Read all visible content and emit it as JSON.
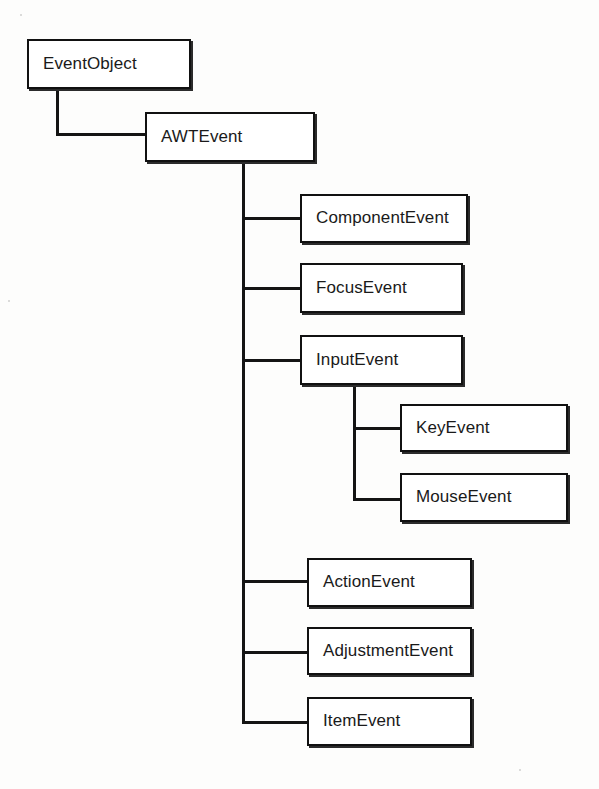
{
  "diagram": {
    "type": "class-hierarchy-tree",
    "background_color": "#fdfdfc",
    "line_color": "#141414",
    "box_fill": "#ffffff",
    "box_border_color": "#111111",
    "nodes": [
      {
        "id": "eventobject",
        "label": "EventObject",
        "x": 27,
        "y": 39,
        "w": 164,
        "h": 50,
        "level": 0
      },
      {
        "id": "awtevent",
        "label": "AWTEvent",
        "x": 145,
        "y": 112,
        "w": 170,
        "h": 50,
        "level": 1
      },
      {
        "id": "componentevent",
        "label": "ComponentEvent",
        "x": 300,
        "y": 194,
        "w": 168,
        "h": 49,
        "level": 2
      },
      {
        "id": "focusevent",
        "label": "FocusEvent",
        "x": 300,
        "y": 263,
        "w": 163,
        "h": 50,
        "level": 2
      },
      {
        "id": "inputevent",
        "label": "InputEvent",
        "x": 300,
        "y": 335,
        "w": 163,
        "h": 50,
        "level": 2
      },
      {
        "id": "keyevent",
        "label": "KeyEvent",
        "x": 400,
        "y": 404,
        "w": 168,
        "h": 48,
        "level": 3
      },
      {
        "id": "mouseevent",
        "label": "MouseEvent",
        "x": 400,
        "y": 473,
        "w": 168,
        "h": 49,
        "level": 3
      },
      {
        "id": "actionevent",
        "label": "ActionEvent",
        "x": 307,
        "y": 558,
        "w": 165,
        "h": 49,
        "level": 2
      },
      {
        "id": "adjustmentevent",
        "label": "AdjustmentEvent",
        "x": 307,
        "y": 627,
        "w": 165,
        "h": 48,
        "level": 2
      },
      {
        "id": "itemevent",
        "label": "ItemEvent",
        "x": 307,
        "y": 697,
        "w": 165,
        "h": 49,
        "level": 2
      }
    ],
    "edges": [
      {
        "from": "eventobject",
        "to": "awtevent",
        "style": "orthogonal"
      },
      {
        "from": "awtevent",
        "to": "componentevent",
        "style": "orthogonal"
      },
      {
        "from": "awtevent",
        "to": "focusevent",
        "style": "orthogonal"
      },
      {
        "from": "awtevent",
        "to": "inputevent",
        "style": "orthogonal"
      },
      {
        "from": "inputevent",
        "to": "keyevent",
        "style": "orthogonal"
      },
      {
        "from": "inputevent",
        "to": "mouseevent",
        "style": "orthogonal"
      },
      {
        "from": "awtevent",
        "to": "actionevent",
        "style": "orthogonal"
      },
      {
        "from": "awtevent",
        "to": "adjustmentevent",
        "style": "orthogonal"
      },
      {
        "from": "awtevent",
        "to": "itemevent",
        "style": "orthogonal"
      }
    ]
  }
}
